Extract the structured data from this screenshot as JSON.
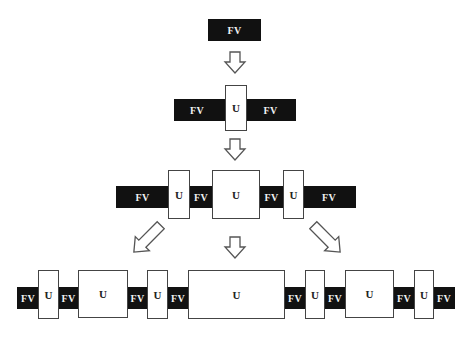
{
  "diagram": {
    "type": "domain-insertion-progression",
    "labels": {
      "fv": "FV",
      "u": "U"
    },
    "colors": {
      "fv_fill": "#111111",
      "fv_text": "#f2f2f2",
      "u_fill": "#ffffff",
      "u_border": "#444444",
      "arrow_stroke": "#555555"
    },
    "rows": [
      {
        "level": 1,
        "segments": [
          "FV"
        ]
      },
      {
        "level": 2,
        "segments": [
          "FV",
          "U",
          "FV"
        ]
      },
      {
        "level": 3,
        "segments": [
          "FV",
          "U",
          "FV",
          "U",
          "FV",
          "U",
          "FV"
        ]
      },
      {
        "level": 4,
        "segments": [
          "FV",
          "U",
          "FV",
          "U",
          "FV",
          "U",
          "FV",
          "U",
          "FV",
          "U",
          "FV",
          "U",
          "FV",
          "U",
          "FV"
        ]
      }
    ],
    "arrows": [
      "down",
      "down",
      "down-left",
      "down",
      "down-right"
    ]
  }
}
